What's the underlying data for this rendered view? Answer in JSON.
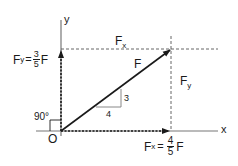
{
  "diagram": {
    "colors": {
      "line": "#1a1a1a",
      "dashed": "#555555",
      "axis": "#777777",
      "triangle": "#888888",
      "background": "#ffffff"
    },
    "axes": {
      "x_label": "x",
      "y_label": "y",
      "origin_label": "O"
    },
    "vector": {
      "label": "F"
    },
    "angle": {
      "label": "90°"
    },
    "slope_triangle": {
      "run": "4",
      "rise": "3"
    },
    "components": {
      "fx_top": {
        "symbol": "F",
        "sub": "x"
      },
      "fy_right": {
        "symbol": "F",
        "sub": "y"
      },
      "fx_eq": {
        "symbol": "F",
        "sub": "x",
        "eq": "=",
        "num": "4",
        "den": "5",
        "suffix": "F"
      },
      "fy_eq": {
        "symbol": "F",
        "sub": "y",
        "eq": "=",
        "num": "3",
        "den": "5",
        "suffix": "F"
      }
    }
  }
}
